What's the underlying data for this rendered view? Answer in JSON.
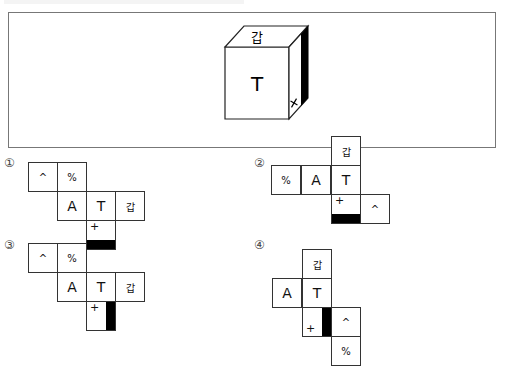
{
  "question": {
    "header_text": "",
    "cube": {
      "top_face": "갑",
      "front_face": "T",
      "right_face_mark": "+",
      "right_face_bar": "black strip on right edge"
    }
  },
  "options": [
    {
      "label": "①",
      "cells": [
        {
          "text": "^",
          "col": 0,
          "row": 0
        },
        {
          "text": "%",
          "col": 1,
          "row": 0
        },
        {
          "text": "A",
          "col": 1,
          "row": 1
        },
        {
          "text": "T",
          "col": 2,
          "row": 1
        },
        {
          "text": "갑",
          "col": 3,
          "row": 1
        },
        {
          "text": "+",
          "col": 2,
          "row": 2,
          "bar": "bottom"
        }
      ]
    },
    {
      "label": "②",
      "cells": [
        {
          "text": "갑",
          "col": 2,
          "row": 0
        },
        {
          "text": "%",
          "col": 0,
          "row": 1
        },
        {
          "text": "A",
          "col": 1,
          "row": 1
        },
        {
          "text": "T",
          "col": 2,
          "row": 1
        },
        {
          "text": "+",
          "col": 2,
          "row": 2,
          "bar": "bottom"
        },
        {
          "text": "^",
          "col": 3,
          "row": 2
        }
      ]
    },
    {
      "label": "③",
      "cells": [
        {
          "text": "^",
          "col": 0,
          "row": 0
        },
        {
          "text": "%",
          "col": 1,
          "row": 0
        },
        {
          "text": "A",
          "col": 1,
          "row": 1
        },
        {
          "text": "T",
          "col": 2,
          "row": 1
        },
        {
          "text": "갑",
          "col": 3,
          "row": 1
        },
        {
          "text": "+",
          "col": 2,
          "row": 2,
          "bar": "right"
        }
      ]
    },
    {
      "label": "④",
      "cells": [
        {
          "text": "갑",
          "col": 1,
          "row": 0
        },
        {
          "text": "A",
          "col": 0,
          "row": 1
        },
        {
          "text": "T",
          "col": 1,
          "row": 1
        },
        {
          "text": "+",
          "col": 1,
          "row": 2,
          "bar": "right"
        },
        {
          "text": "^",
          "col": 2,
          "row": 2
        },
        {
          "text": "%",
          "col": 2,
          "row": 3
        }
      ]
    }
  ]
}
